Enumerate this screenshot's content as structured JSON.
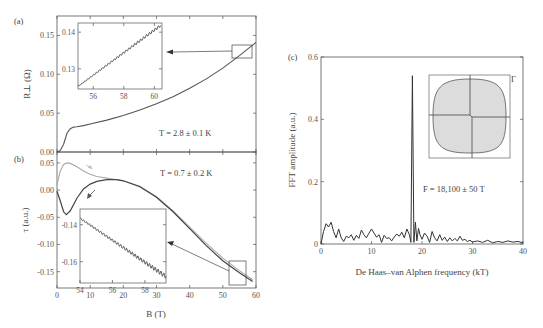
{
  "chart_data": [
    {
      "panel": "(a)",
      "type": "line",
      "xlabel": "B (T)",
      "ylabel": "R⊥ (Ω)",
      "xlim": [
        0,
        60
      ],
      "ylim": [
        0,
        0.175
      ],
      "yticks": [
        "0.00",
        "0.05",
        "0.10",
        "0.15"
      ],
      "annotation": "T = 2.8 ± 0.1 K",
      "series": [
        {
          "name": "R_perp",
          "color": "#555555",
          "x": [
            0,
            1,
            2,
            3,
            4,
            5,
            6,
            8,
            10,
            15,
            20,
            25,
            30,
            35,
            40,
            45,
            50,
            55,
            60
          ],
          "y": [
            0.0,
            0.002,
            0.01,
            0.024,
            0.03,
            0.032,
            0.0325,
            0.034,
            0.036,
            0.041,
            0.047,
            0.054,
            0.062,
            0.071,
            0.082,
            0.094,
            0.108,
            0.124,
            0.141
          ]
        }
      ],
      "inset": {
        "xticks": [
          "56",
          "58",
          "60"
        ],
        "yticks": [
          "0.13",
          "0.14"
        ],
        "xlim": [
          55,
          60.5
        ],
        "ylim": [
          0.1245,
          0.1425
        ],
        "description": "Zoom 55–60.5 T showing small quantum oscillations on linear rise"
      }
    },
    {
      "panel": "(b)",
      "type": "line",
      "xlabel": "B (T)",
      "ylabel": "τ (a.u.)",
      "xlim": [
        0,
        60
      ],
      "ylim": [
        -0.18,
        0.07
      ],
      "xticks": [
        "0",
        "10",
        "20",
        "30",
        "40",
        "50",
        "60"
      ],
      "yticks": [
        "0.05",
        "0.00",
        "-0.05",
        "-0.10",
        "-0.15"
      ],
      "annotation": "T = 0.7 ± 0.2 K",
      "series": [
        {
          "name": "up-sweep",
          "color": "#aaaaaa",
          "x": [
            0,
            1,
            2,
            3,
            4,
            6,
            8,
            10,
            12,
            15,
            18,
            20,
            25,
            30,
            35,
            40,
            45,
            50,
            55,
            59
          ],
          "y": [
            0.01,
            0.035,
            0.047,
            0.05,
            0.049,
            0.043,
            0.035,
            0.029,
            0.025,
            0.022,
            0.019,
            0.017,
            0.007,
            -0.012,
            -0.038,
            -0.068,
            -0.098,
            -0.125,
            -0.148,
            -0.165
          ]
        },
        {
          "name": "down-sweep",
          "color": "#444444",
          "x": [
            0,
            1,
            2,
            2.8,
            4,
            6,
            8,
            10,
            12,
            15,
            18,
            20,
            25,
            30,
            35,
            40,
            45,
            50,
            55,
            59
          ],
          "y": [
            -0.002,
            -0.02,
            -0.04,
            -0.045,
            -0.038,
            -0.015,
            0.002,
            0.011,
            0.016,
            0.019,
            0.019,
            0.017,
            0.006,
            -0.013,
            -0.04,
            -0.071,
            -0.102,
            -0.13,
            -0.152,
            -0.168
          ]
        }
      ],
      "inset": {
        "xticks": [
          "54",
          "56",
          "58"
        ],
        "yticks": [
          "-0.14",
          "-0.16"
        ],
        "xlim": [
          54,
          59.3
        ],
        "ylim": [
          -0.1715,
          -0.1315
        ],
        "description": "Zoom 54–59.3 T showing de Haas–van Alphen oscillations in torque"
      }
    },
    {
      "panel": "(c)",
      "type": "line",
      "xlabel": "De Haas–van Alphen frequency (kT)",
      "ylabel": "FFT amplitude (a.u.)",
      "xlim": [
        0,
        40
      ],
      "ylim": [
        0,
        0.6
      ],
      "xticks": [
        "0",
        "10",
        "20",
        "30",
        "40"
      ],
      "yticks": [
        "0",
        "0.2",
        "0.4",
        "0.6"
      ],
      "annotation": "F = 18,100 ± 50 T",
      "inset_label": "Γ",
      "series": [
        {
          "name": "FFT",
          "color": "#333333",
          "x": [
            0,
            0.5,
            1,
            1.5,
            2,
            2.5,
            3,
            3.5,
            4,
            4.5,
            5,
            5.5,
            6,
            6.5,
            7,
            7.5,
            8,
            8.5,
            9,
            9.5,
            10,
            10.5,
            11,
            11.5,
            12,
            12.5,
            13,
            13.5,
            14,
            14.5,
            15,
            15.5,
            16,
            16.5,
            17,
            17.5,
            17.8,
            18.1,
            18.4,
            18.7,
            19,
            19.3,
            19.6,
            20,
            20.5,
            21,
            21.5,
            22,
            22.5,
            23,
            23.5,
            24,
            24.5,
            25,
            25.5,
            26,
            26.5,
            27,
            27.5,
            28,
            28.5,
            29,
            29.5,
            30,
            31,
            32,
            33,
            34,
            35,
            36,
            37,
            38,
            39,
            40
          ],
          "y": [
            0,
            0.04,
            0.065,
            0.055,
            0.07,
            0.04,
            0.02,
            0.048,
            0.02,
            0.008,
            0.025,
            0.02,
            0.03,
            0.012,
            0.028,
            0.018,
            0.045,
            0.03,
            0.02,
            0.035,
            0.048,
            0.035,
            0.022,
            0.03,
            0.005,
            0.028,
            0.018,
            0.02,
            0.01,
            0.022,
            0.032,
            0.025,
            0.038,
            0.02,
            0.048,
            0.03,
            0.005,
            0.54,
            0.005,
            0.07,
            0.01,
            0.05,
            0.03,
            0.015,
            0.035,
            0.025,
            0.005,
            0.04,
            0.02,
            0.01,
            0.03,
            0.012,
            0.022,
            0.008,
            0.02,
            0.01,
            0.018,
            0.01,
            0.025,
            0.012,
            0.015,
            0.008,
            0.012,
            0.006,
            0.01,
            0.005,
            0.012,
            0.004,
            0.008,
            0.005,
            0.01,
            0.006,
            0.008,
            0.004
          ]
        }
      ]
    }
  ],
  "labels": {
    "a": "(a)",
    "b": "(b)",
    "c": "(c)",
    "a_ylabel": "R⊥ (Ω)",
    "b_ylabel": "τ (a.u.)",
    "b_xlabel": "B (T)",
    "c_ylabel": "FFT amplitude (a.u.)",
    "c_xlabel": "De Haas–van Alphen frequency (kT)",
    "a_annot": "T = 2.8 ± 0.1 K",
    "b_annot": "T = 0.7 ± 0.2 K",
    "c_annot": "F = 18,100 ± 50 T",
    "gamma": "Γ"
  }
}
